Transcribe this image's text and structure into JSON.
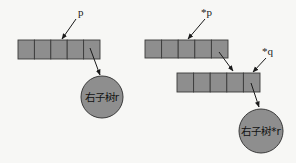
{
  "diagram": {
    "left": {
      "pointer_label": "p",
      "array_cells": 5,
      "node_label": "右子树r"
    },
    "right": {
      "pointer_p_label": "*p",
      "pointer_q_label": "*q",
      "top_array_cells": 5,
      "bottom_array_cells": 5,
      "node_label": "右子树*r"
    },
    "colors": {
      "fill": "#8e8e8e",
      "stroke": "#3a3a3a",
      "background": "#f7f7f5"
    }
  }
}
